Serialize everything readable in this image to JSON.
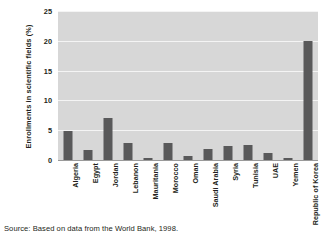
{
  "chart_data": {
    "type": "bar",
    "title": "",
    "subtitle": "",
    "xlabel": "",
    "ylabel": "Enrollments in scientific fields (%)",
    "ylim": [
      0,
      25
    ],
    "yticks": [
      25,
      20,
      15,
      10,
      5,
      0
    ],
    "grid": true,
    "legend": null,
    "legend_position": "none",
    "orientation": "vertical",
    "categories": [
      "Algeria",
      "Egypt",
      "Jordan",
      "Lebanon",
      "Mauritania",
      "Morocco",
      "Oman",
      "Saudi Arabia",
      "Syria",
      "Tunisia",
      "UAE",
      "Yemen",
      "Republic of Korea"
    ],
    "values": [
      4.8,
      1.6,
      7.0,
      2.9,
      0.4,
      2.8,
      0.7,
      1.8,
      2.4,
      2.6,
      1.1,
      0.3,
      20.0
    ],
    "series": [
      {
        "name": "Enrollments in scientific fields (%)",
        "values": [
          4.8,
          1.6,
          7.0,
          2.9,
          0.4,
          2.8,
          0.7,
          1.8,
          2.4,
          2.6,
          1.1,
          0.3,
          20.0
        ]
      }
    ],
    "colors": {
      "bar": "#59595a",
      "plot_background": "#d7d7d7",
      "gridline": "#f4f4f4",
      "axis": "#9a9a9a",
      "text": "#231f20",
      "page_background": "#ffffff"
    }
  },
  "source": {
    "text": "Source: Based on data from the World Bank, 1998."
  }
}
